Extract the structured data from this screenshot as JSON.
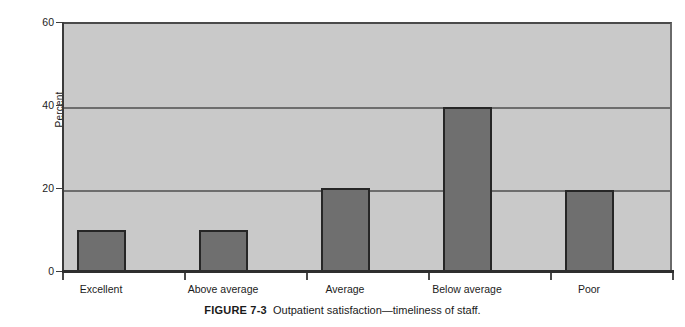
{
  "figure": {
    "caption_label": "FIGURE 7-3",
    "caption_text": "Outpatient satisfaction—timeliness of staff."
  },
  "chart_data": {
    "type": "bar",
    "title": "",
    "subtitle": "",
    "xlabel": "",
    "ylabel": "Percent",
    "categories": [
      "Excellent",
      "Above average",
      "Average",
      "Below average",
      "Poor"
    ],
    "values": [
      10,
      10,
      20,
      39.5,
      19.5
    ],
    "series": [
      {
        "name": "Percent",
        "values": [
          10,
          10,
          20,
          39.5,
          19.5
        ]
      }
    ],
    "ylim": [
      0,
      60
    ],
    "yticks": [
      0,
      20,
      40,
      60
    ],
    "ytick_labels": [
      "0",
      "20",
      "40",
      "60"
    ],
    "gridlines": [
      20,
      40
    ],
    "grid": true,
    "legend": false,
    "legend_position": "none",
    "plot_background_color": "#c9c9c9",
    "bar_fill_color": "#6f6f6f",
    "bar_border_color": "#262626",
    "gridline_color": "#6d6d6d",
    "axis_color": "#2e2e2e"
  }
}
